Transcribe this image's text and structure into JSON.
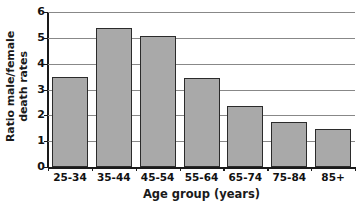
{
  "chart_data": {
    "type": "bar",
    "title": "",
    "subtitle": "",
    "xlabel": "Age group (years)",
    "ylabel_line1": "Ratio male/female",
    "ylabel_line2": "death rates",
    "ylabel": "Ratio male/female death rates",
    "categories": [
      "25-34",
      "35-44",
      "45-54",
      "55-64",
      "65-74",
      "75-84",
      "85+"
    ],
    "values": [
      3.48,
      5.4,
      5.07,
      3.43,
      2.38,
      1.76,
      1.48
    ],
    "series": [
      {
        "name": "Ratio male/female death rates",
        "values": [
          3.48,
          5.4,
          5.07,
          3.43,
          2.38,
          1.76,
          1.48
        ]
      }
    ],
    "ylim": [
      0,
      6
    ],
    "yticks": [
      0,
      1,
      2,
      3,
      4,
      5,
      6
    ],
    "ytick_labels": [
      "0",
      "1",
      "2",
      "3",
      "4",
      "5",
      "6"
    ],
    "xlim_categories": 7,
    "grid": true,
    "grid_axis": "y",
    "legend": false,
    "legend_position": "none",
    "colors": {
      "bar_fill": "#a9a9a9",
      "bar_border": "#2b2b2b",
      "gridline": "#888888",
      "axis": "#1a1a1a",
      "text": "#111111",
      "background": "#ffffff"
    }
  }
}
